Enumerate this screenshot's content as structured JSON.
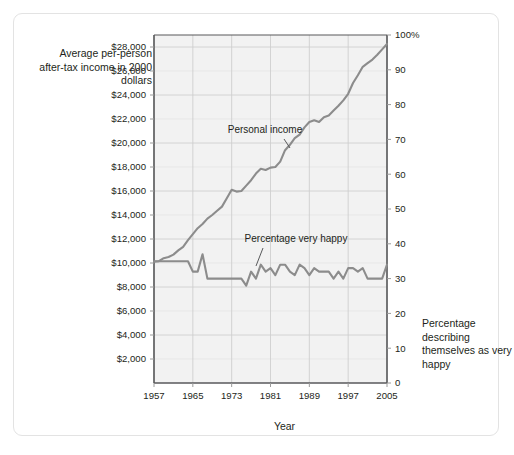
{
  "figure": {
    "left_axis_title": "Average per-person after-tax income in 2000 dollars",
    "right_axis_title": "Percentage describing themselves as very happy",
    "x_axis_title": "Year",
    "line_color": "#8c8c8c",
    "grid_color": "#d9d9d9",
    "axis_color": "#58595b",
    "plot_bg": "#f2f2f2",
    "border_color": "#e3e3e3"
  },
  "chart_data": {
    "type": "line",
    "title": "",
    "xlabel": "Year",
    "ylabel": "Average per-person after-tax income in 2000 dollars",
    "y2label": "Percentage describing themselves as very happy",
    "xlim": [
      1957,
      2005
    ],
    "ylim": [
      0,
      29000
    ],
    "y2lim": [
      0,
      100
    ],
    "grid": true,
    "legend": "annotations-inline",
    "xticks": [
      1957,
      1965,
      1973,
      1981,
      1989,
      1997,
      2005
    ],
    "xticklabels": [
      "1957",
      "1965",
      "1973",
      "1981",
      "1989",
      "1997",
      "2005"
    ],
    "yticks": [
      2000,
      4000,
      6000,
      8000,
      10000,
      12000,
      14000,
      16000,
      18000,
      20000,
      22000,
      24000,
      26000,
      28000
    ],
    "yticklabels": [
      "$2,000",
      "$4,000",
      "$6,000",
      "$8,000",
      "$10,000",
      "$12,000",
      "$14,000",
      "$16,000",
      "$18,000",
      "$20,000",
      "$22,000",
      "$24,000",
      "$26,000",
      "$28,000"
    ],
    "y2ticks": [
      0,
      10,
      20,
      30,
      40,
      50,
      60,
      70,
      80,
      90,
      100
    ],
    "y2ticklabels": [
      "0",
      "10",
      "20",
      "30",
      "40",
      "50",
      "60",
      "70",
      "80",
      "90",
      "100%"
    ],
    "x": [
      1957,
      1958,
      1959,
      1960,
      1961,
      1962,
      1963,
      1964,
      1965,
      1966,
      1967,
      1968,
      1969,
      1970,
      1971,
      1972,
      1973,
      1974,
      1975,
      1976,
      1977,
      1978,
      1979,
      1980,
      1981,
      1982,
      1983,
      1984,
      1985,
      1986,
      1987,
      1988,
      1989,
      1990,
      1991,
      1992,
      1993,
      1994,
      1995,
      1996,
      1997,
      1998,
      1999,
      2000,
      2001,
      2002,
      2003,
      2004,
      2005
    ],
    "series": [
      {
        "name": "Personal income",
        "axis": "left",
        "annotation": "Personal income",
        "values": [
          10100,
          10150,
          10400,
          10500,
          10700,
          11050,
          11350,
          11900,
          12400,
          12900,
          13250,
          13700,
          14000,
          14350,
          14700,
          15400,
          16100,
          15950,
          16000,
          16450,
          16900,
          17450,
          17850,
          17750,
          17950,
          18000,
          18450,
          19400,
          19850,
          20400,
          20700,
          21300,
          21750,
          21900,
          21750,
          22150,
          22300,
          22700,
          23100,
          23550,
          24100,
          25000,
          25650,
          26350,
          26650,
          26950,
          27350,
          27800,
          28250
        ]
      },
      {
        "name": "Percentage very happy",
        "axis": "right",
        "annotation": "Percentage very happy",
        "values": [
          35,
          35,
          35,
          35,
          35,
          35,
          35,
          35,
          32,
          32,
          37,
          30,
          30,
          30,
          30,
          30,
          30,
          30,
          30,
          28,
          32,
          30,
          34,
          32,
          33,
          31,
          34,
          34,
          32,
          31,
          34,
          33,
          31,
          33,
          32,
          32,
          32,
          30,
          32,
          30,
          33,
          33,
          32,
          33,
          30,
          30,
          30,
          30,
          34
        ]
      }
    ]
  }
}
